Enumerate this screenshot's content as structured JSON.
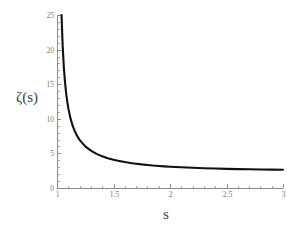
{
  "chart_data": {
    "type": "line",
    "title": "",
    "subtitle": "",
    "xlabel": "s",
    "ylabel": "ζ(s)",
    "xlim": [
      1,
      3
    ],
    "ylim": [
      0,
      25
    ],
    "grid": false,
    "legend": false,
    "legend_position": "none",
    "x_ticks": [
      {
        "value": 1,
        "label": "1"
      },
      {
        "value": 1.5,
        "label": "1.5"
      },
      {
        "value": 2,
        "label": "2"
      },
      {
        "value": 2.5,
        "label": "2.5"
      },
      {
        "value": 3,
        "label": "3"
      }
    ],
    "y_ticks": [
      {
        "value": 0,
        "label": "0"
      },
      {
        "value": 5,
        "label": "5"
      },
      {
        "value": 10,
        "label": "10"
      },
      {
        "value": 15,
        "label": "15"
      },
      {
        "value": 20,
        "label": "20"
      },
      {
        "value": 25,
        "label": "25"
      }
    ],
    "x_minor_step": 0.1,
    "y_minor_step": 1,
    "series": [
      {
        "name": "zeta",
        "color": "#111111",
        "x": [
          1.04,
          1.05,
          1.06,
          1.07,
          1.08,
          1.09,
          1.1,
          1.12,
          1.14,
          1.16,
          1.18,
          1.2,
          1.25,
          1.3,
          1.35,
          1.4,
          1.45,
          1.5,
          1.55,
          1.6,
          1.65,
          1.7,
          1.75,
          1.8,
          1.85,
          1.9,
          1.95,
          2.0,
          2.1,
          2.2,
          2.3,
          2.4,
          2.5,
          2.6,
          2.7,
          2.8,
          2.9,
          3.0
        ],
        "values": [
          25.0,
          20.58,
          17.58,
          15.43,
          13.81,
          12.55,
          11.54,
          10.02,
          8.93,
          8.12,
          7.48,
          6.96,
          6.02,
          5.39,
          4.93,
          4.59,
          4.31,
          4.09,
          3.91,
          3.75,
          3.62,
          3.51,
          3.41,
          3.33,
          3.25,
          3.19,
          3.13,
          3.08,
          2.99,
          2.92,
          2.86,
          2.81,
          2.76,
          2.73,
          2.7,
          2.67,
          2.65,
          2.63
        ]
      }
    ]
  },
  "labels": {
    "y_axis_title": "ζ(s)",
    "x_axis_title": "s"
  },
  "colors": {
    "curve": "#111111",
    "axis": "#8c8c8c",
    "tick_label": "#7a7a7a",
    "background": "#ffffff"
  }
}
